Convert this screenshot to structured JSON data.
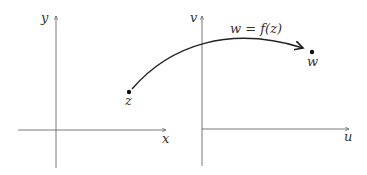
{
  "diagram": {
    "left_plane": {
      "x_axis_label": "x",
      "y_axis_label": "y",
      "point_label": "z"
    },
    "right_plane": {
      "x_axis_label": "u",
      "y_axis_label": "v",
      "point_label": "w"
    },
    "mapping_label": "w = f(z)",
    "colors": {
      "axis": "#555555",
      "curve": "#222222",
      "text": "#333333"
    }
  }
}
